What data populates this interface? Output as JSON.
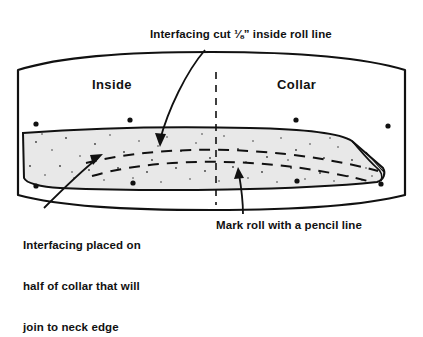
{
  "diagram": {
    "title_note": "Sewing instruction diagram of a collar piece with interfacing",
    "labels": {
      "top_caption": "Interfacing cut ⅛” inside roll line",
      "inside": "Inside",
      "collar": "Collar",
      "bottom_left_caption_line1": "Interfacing placed on",
      "bottom_left_caption_line2": "half of collar that will",
      "bottom_left_caption_line3": "join to neck edge",
      "bottom_right_caption": "Mark roll with a pencil line"
    },
    "colors": {
      "ink": "#111111",
      "paper": "#ffffff",
      "interfacing_fill": "#e8e8e8",
      "speckle": "#444444"
    }
  }
}
